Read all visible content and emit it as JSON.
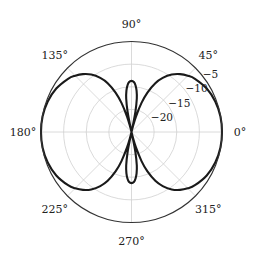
{
  "chart_data": {
    "type": "polar",
    "title": "",
    "angular_axis": {
      "unit": "degrees",
      "tick_labels": [
        "0°",
        "45°",
        "90°",
        "135°",
        "180°",
        "225°",
        "270°",
        "315°"
      ],
      "tick_angles": [
        0,
        45,
        90,
        135,
        180,
        225,
        270,
        315
      ]
    },
    "radial_axis": {
      "unit": "dB",
      "range": [
        -25,
        -5
      ],
      "ticks": [
        -20,
        -15,
        -10,
        -5
      ],
      "tick_labels": [
        "−20",
        "−15",
        "−10",
        "−5"
      ],
      "label_angle_deg": 40,
      "grid": true
    },
    "series": [
      {
        "name": "pattern",
        "color": "#1a1a1a",
        "symmetry": "mirror about 0° and 90° axes",
        "theta_deg": [
          0,
          10,
          20,
          30,
          40,
          45,
          50,
          55,
          60,
          64,
          68,
          71,
          74,
          76,
          77,
          78,
          79,
          81,
          83,
          85,
          87,
          90
        ],
        "r_db": [
          -5,
          -5.05,
          -5.3,
          -5.8,
          -6.7,
          -7.4,
          -8.3,
          -9.5,
          -11.2,
          -13.0,
          -15.6,
          -18.2,
          -21.5,
          -24.0,
          -25,
          -24.0,
          -20.5,
          -17.5,
          -15.8,
          -14.7,
          -14.0,
          -13.7
        ]
      }
    ],
    "legend": null,
    "grid": true
  },
  "colors": {
    "grid": "#d0d0d0",
    "outer_ring": "#333333",
    "curve": "#1a1a1a",
    "text": "#222222"
  }
}
